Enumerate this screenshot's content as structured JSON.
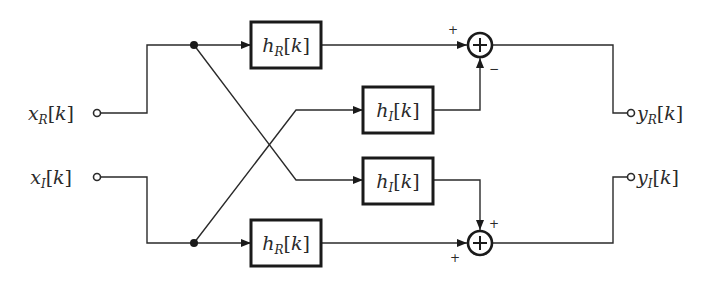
{
  "diagram": {
    "type": "block-diagram",
    "inputs": [
      {
        "id": "xR",
        "base": "x",
        "sub": "R",
        "arg": "k",
        "label": "x_R[k]"
      },
      {
        "id": "xI",
        "base": "x",
        "sub": "I",
        "arg": "k",
        "label": "x_I[k]"
      }
    ],
    "outputs": [
      {
        "id": "yR",
        "base": "y",
        "sub": "R",
        "arg": "k",
        "label": "y_R[k]"
      },
      {
        "id": "yI",
        "base": "y",
        "sub": "I",
        "arg": "k",
        "label": "y_I[k]"
      }
    ],
    "blocks": [
      {
        "id": "hR_top",
        "base": "h",
        "sub": "R",
        "arg": "k",
        "label": "h_R[k]",
        "input": "xR"
      },
      {
        "id": "hI_upper",
        "base": "h",
        "sub": "I",
        "arg": "k",
        "label": "h_I[k]",
        "input": "xI"
      },
      {
        "id": "hI_lower",
        "base": "h",
        "sub": "I",
        "arg": "k",
        "label": "h_I[k]",
        "input": "xR"
      },
      {
        "id": "hR_bottom",
        "base": "h",
        "sub": "R",
        "arg": "k",
        "label": "h_R[k]",
        "input": "xI"
      }
    ],
    "summers": [
      {
        "id": "sum_top",
        "symbol": "+",
        "inputs": [
          {
            "from": "hR_top",
            "sign": "+"
          },
          {
            "from": "hI_upper",
            "sign": "−"
          }
        ],
        "output": "yR"
      },
      {
        "id": "sum_bottom",
        "symbol": "+",
        "inputs": [
          {
            "from": "hR_bottom",
            "sign": "+"
          },
          {
            "from": "hI_lower",
            "sign": "+"
          }
        ],
        "output": "yI"
      }
    ],
    "signs": {
      "top_left": "+",
      "top_bottom": "−",
      "bottom_top": "+",
      "bottom_left": "+"
    },
    "bracket_open": "[",
    "bracket_close": "]"
  }
}
